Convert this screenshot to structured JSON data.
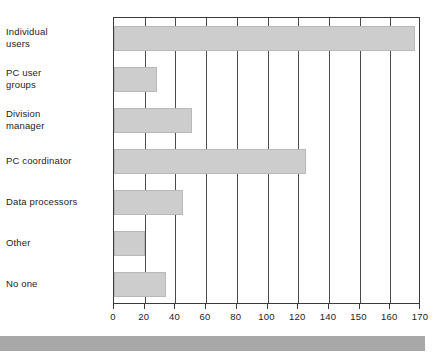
{
  "chart_data": {
    "type": "bar",
    "orientation": "horizontal",
    "title": "",
    "subtitle": "",
    "xlabel": "",
    "ylabel": "",
    "categories": [
      "Individual\nusers",
      "PC user\ngroups",
      "Division\nmanager",
      "PC coordinator",
      "Data processors",
      "Other",
      "No one"
    ],
    "values": [
      168,
      28,
      51,
      125,
      45,
      20,
      34
    ],
    "tick_labels": [
      "0",
      "20",
      "40",
      "60",
      "80",
      "100",
      "120",
      "140",
      "150",
      "160",
      "170"
    ],
    "tick_values": [
      0,
      20,
      40,
      60,
      80,
      100,
      120,
      140,
      150,
      160,
      170
    ],
    "axis_note": "Tick marks are evenly spaced although the labelled interval changes from 20 to 10 after 140.",
    "xlim": [
      0,
      170
    ],
    "grid": true,
    "legend": null,
    "legend_position": "none",
    "bar_color": "#cdcdcd",
    "bar_edge_color": "#b9b9b9",
    "axis_color": "#3a3a3a",
    "background_color": "#ffffff"
  },
  "decor": {
    "scan_band_color": "#a8a8a8"
  }
}
